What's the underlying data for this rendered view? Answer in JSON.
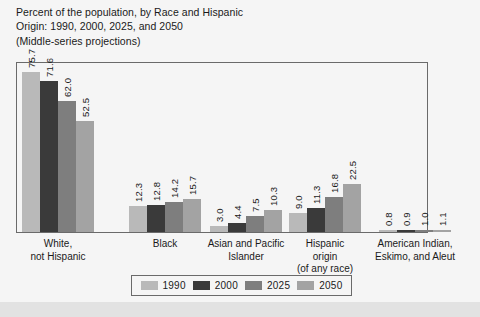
{
  "title": {
    "line1": "Percent of the population, by Race and Hispanic",
    "line2": "Origin: 1990, 2000, 2025, and 2050",
    "line3": "(Middle-series projections)"
  },
  "footer": {
    "text": ""
  },
  "legend": {
    "items": [
      {
        "label": "1990",
        "color": "#b9b9b9"
      },
      {
        "label": "2000",
        "color": "#3a3a3a"
      },
      {
        "label": "2025",
        "color": "#7e7e7e"
      },
      {
        "label": "2050",
        "color": "#a3a3a3"
      }
    ]
  },
  "chart_data": {
    "type": "bar",
    "title": "Percent of the population, by Race and Hispanic Origin: 1990, 2000, 2025, and 2050 (Middle-series projections)",
    "xlabel": "",
    "ylabel": "",
    "ylim": [
      0,
      80
    ],
    "grid": false,
    "legend_position": "bottom",
    "categories": [
      "White, not Hispanic",
      "Black",
      "Asian and Pacific Islander",
      "Hispanic origin (of any race)",
      "American Indian, Eskimo, and Aleut"
    ],
    "category_lines": [
      [
        "White,",
        "not Hispanic"
      ],
      [
        "Black"
      ],
      [
        "Asian and Pacific",
        "Islander"
      ],
      [
        "Hispanic",
        "origin",
        "(of any race)"
      ],
      [
        "American Indian,",
        "Eskimo, and Aleut"
      ]
    ],
    "series": [
      {
        "name": "1990",
        "color": "#b9b9b9",
        "values": [
          75.7,
          12.3,
          3.0,
          9.0,
          0.8
        ]
      },
      {
        "name": "2000",
        "color": "#3a3a3a",
        "values": [
          71.6,
          12.8,
          4.4,
          11.3,
          0.9
        ]
      },
      {
        "name": "2025",
        "color": "#7e7e7e",
        "values": [
          62.0,
          14.2,
          7.5,
          16.8,
          1.0
        ]
      },
      {
        "name": "2050",
        "color": "#a3a3a3",
        "values": [
          52.5,
          15.7,
          10.3,
          22.5,
          1.1
        ]
      }
    ],
    "value_labels": [
      [
        "75.7",
        "71.6",
        "62.0",
        "52.5"
      ],
      [
        "12.3",
        "12.8",
        "14.2",
        "15.7"
      ],
      [
        "3.0",
        "4.4",
        "7.5",
        "10.3"
      ],
      [
        "9.0",
        "11.3",
        "16.8",
        "22.5"
      ],
      [
        "0.8",
        "0.9",
        "1.0",
        "1.1"
      ]
    ]
  }
}
